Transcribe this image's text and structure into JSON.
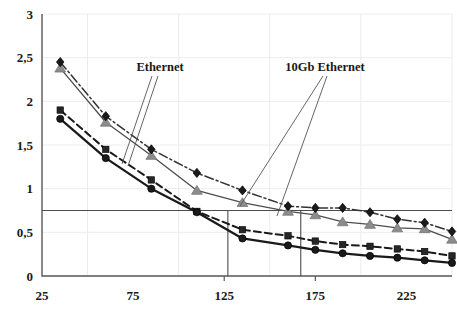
{
  "chart_data": {
    "type": "line",
    "title": "",
    "xlabel": "",
    "ylabel": "",
    "xlim": [
      25,
      250
    ],
    "ylim": [
      0,
      3
    ],
    "xticks": [
      25,
      75,
      125,
      175,
      225
    ],
    "xtick_labels": [
      "25",
      "75",
      "125",
      "175",
      "225"
    ],
    "yticks": [
      0,
      0.5,
      1,
      1.5,
      2,
      2.5,
      3
    ],
    "ytick_labels": [
      "0",
      "0,5",
      "1",
      "1,5",
      "2",
      "2,5",
      "3"
    ],
    "grid": true,
    "legend_position": "none",
    "x": [
      35,
      60,
      85,
      110,
      135,
      160,
      175,
      190,
      205,
      220,
      235,
      250
    ],
    "series": [
      {
        "name": "10Gb Ethernet upper",
        "marker": "diamond",
        "marker_color": "#1a1a1a",
        "line_style": "dash-dot",
        "line_color": "#333333",
        "values": [
          2.45,
          1.83,
          1.45,
          1.18,
          0.98,
          0.8,
          0.78,
          0.78,
          0.73,
          0.65,
          0.61,
          0.51
        ]
      },
      {
        "name": "10Gb Ethernet lower",
        "marker": "triangle",
        "marker_color": "#8c8c8c",
        "line_style": "solid-thin",
        "line_color": "#4d4d4d",
        "values": [
          2.38,
          1.76,
          1.38,
          0.98,
          0.84,
          0.74,
          0.7,
          0.62,
          0.59,
          0.55,
          0.54,
          0.42
        ]
      },
      {
        "name": "Ethernet upper",
        "marker": "square",
        "marker_color": "#262626",
        "line_style": "dashed",
        "line_color": "#1a1a1a",
        "values": [
          1.9,
          1.45,
          1.1,
          0.74,
          0.53,
          0.46,
          0.4,
          0.36,
          0.34,
          0.31,
          0.28,
          0.23
        ]
      },
      {
        "name": "Ethernet lower",
        "marker": "circle",
        "marker_color": "#1a1a1a",
        "line_style": "solid-thick",
        "line_color": "#1a1a1a",
        "values": [
          1.8,
          1.35,
          1.0,
          0.73,
          0.43,
          0.35,
          0.3,
          0.26,
          0.23,
          0.21,
          0.18,
          0.15
        ]
      }
    ],
    "reference_lines": [
      {
        "name": "threshold-horizontal",
        "orientation": "horizontal",
        "value": 0.75
      },
      {
        "name": "marker-vertical-left",
        "orientation": "vertical",
        "value": 127
      },
      {
        "name": "marker-vertical-right",
        "orientation": "vertical",
        "value": 167
      }
    ],
    "annotations": [
      {
        "id": "ethernet",
        "label": "Ethernet",
        "label_x": 160,
        "label_y": 71,
        "leaders": [
          {
            "x1": 158,
            "y1": 76,
            "x2": 128,
            "y2": 166
          },
          {
            "x1": 152,
            "y1": 76,
            "x2": 122,
            "y2": 164
          }
        ]
      },
      {
        "id": "tengb-ethernet",
        "label": "10Gb Ethernet",
        "label_x": 325,
        "label_y": 71,
        "leaders": [
          {
            "x1": 323,
            "y1": 76,
            "x2": 240,
            "y2": 206
          },
          {
            "x1": 327,
            "y1": 76,
            "x2": 277,
            "y2": 216
          }
        ]
      }
    ]
  },
  "axis_labels": {
    "y": [
      "3",
      "2,5",
      "2",
      "1,5",
      "1",
      "0,5",
      "0"
    ],
    "x": [
      "25",
      "75",
      "125",
      "175",
      "225"
    ]
  }
}
